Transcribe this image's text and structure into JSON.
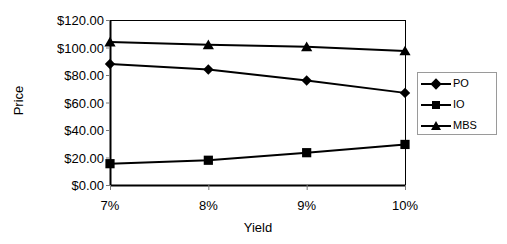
{
  "chart_data": {
    "type": "line",
    "title": "",
    "xlabel": "Yield",
    "ylabel": "Price",
    "categories": [
      "7%",
      "8%",
      "9%",
      "10%"
    ],
    "x_tick_labels": [
      "7%",
      "8%",
      "9%",
      "10%"
    ],
    "y_tick_labels": [
      "$0.00",
      "$20.00",
      "$40.00",
      "$60.00",
      "$80.00",
      "$100.00",
      "$120.00"
    ],
    "y_tick_values": [
      0,
      20,
      40,
      60,
      80,
      100,
      120
    ],
    "ylim": [
      0,
      120
    ],
    "grid": false,
    "legend_position": "right",
    "series": [
      {
        "name": "PO",
        "marker": "diamond",
        "color": "#000000",
        "values": [
          88,
          84,
          76,
          67
        ]
      },
      {
        "name": "IO",
        "marker": "square",
        "color": "#000000",
        "values": [
          15.5,
          18,
          23.5,
          29.5
        ]
      },
      {
        "name": "MBS",
        "marker": "triangle",
        "color": "#000000",
        "values": [
          104,
          102,
          100.5,
          97.5
        ]
      }
    ]
  },
  "legend": {
    "entries": [
      {
        "label": "PO",
        "marker": "diamond"
      },
      {
        "label": "IO",
        "marker": "square"
      },
      {
        "label": "MBS",
        "marker": "triangle"
      }
    ]
  },
  "colors": {
    "series": "#000000",
    "axis": "#000000",
    "legend_border": "#9a9a9a",
    "background": "#ffffff"
  }
}
